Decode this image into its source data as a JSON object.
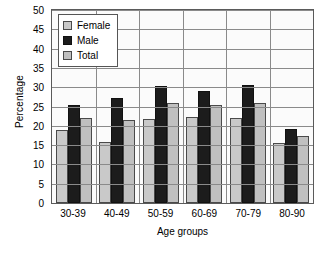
{
  "chart_data": {
    "type": "bar",
    "title": "",
    "xlabel": "Age groups",
    "ylabel": "Percentage",
    "categories": [
      "30-39",
      "40-49",
      "50-59",
      "60-69",
      "70-79",
      "80-90"
    ],
    "series": [
      {
        "name": "Female",
        "color": "#c9c9c9",
        "values": [
          18.8,
          15.8,
          21.8,
          22.4,
          21.9,
          15.6
        ]
      },
      {
        "name": "Male",
        "color": "#1c1c1c",
        "values": [
          25.5,
          27.2,
          30.3,
          29.0,
          30.5,
          19.3
        ]
      },
      {
        "name": "Total",
        "color": "#c0c0c0",
        "values": [
          22.1,
          21.5,
          26.0,
          25.5,
          26.0,
          17.3
        ]
      }
    ],
    "ylim": [
      0,
      50
    ],
    "yticks": [
      50,
      45,
      40,
      35,
      30,
      25,
      20,
      15,
      10,
      5,
      0
    ],
    "grid": true,
    "legend_position": "top-left"
  },
  "caption": ""
}
